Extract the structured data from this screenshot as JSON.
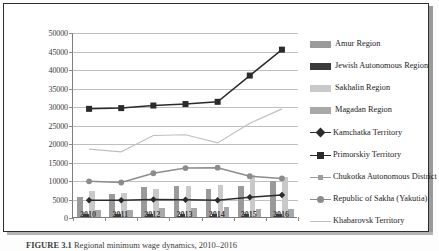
{
  "figure": {
    "caption_prefix": "FIGURE 3.1",
    "caption_text": "Regional minimum wage dynamics, 2010–2016"
  },
  "chart_data": {
    "type": "bar",
    "title": "",
    "xlabel": "",
    "ylabel": "",
    "categories": [
      "2010",
      "2011",
      "2012",
      "2013",
      "2014",
      "2015",
      "2016"
    ],
    "ylim": [
      0,
      50000
    ],
    "ytick_step": 5000,
    "yticks": [
      "0",
      "5000",
      "10000",
      "15000",
      "20000",
      "25000",
      "30000",
      "35000",
      "40000",
      "45000",
      "50000"
    ],
    "grid": true,
    "legend_position": "right",
    "bar_series": [
      {
        "name": "Amur Region",
        "color": "#9a9a9a",
        "values": [
          5500,
          6200,
          8000,
          8400,
          7600,
          8300,
          9800
        ]
      },
      {
        "name": "Jewish Autonomous Region",
        "color": "#3a3a3a",
        "values": [
          700,
          800,
          750,
          950,
          900,
          850,
          900
        ]
      },
      {
        "name": "Sakhalin Region",
        "color": "#c9c9c9",
        "values": [
          7000,
          6500,
          7600,
          8500,
          8600,
          11300,
          10700
        ]
      },
      {
        "name": "Magadan Region",
        "color": "#a8a8a8",
        "values": [
          1800,
          2000,
          2400,
          2500,
          2700,
          2300,
          2300
        ]
      }
    ],
    "line_series": [
      {
        "name": "Kamchatka Territory",
        "color": "#2b2b2b",
        "marker": "diamond",
        "values": [
          4800,
          4800,
          5000,
          4900,
          4800,
          5600,
          6200
        ]
      },
      {
        "name": "Primorskiy Territory",
        "color": "#2b2b2b",
        "marker": "square",
        "values": [
          29500,
          29700,
          30400,
          30800,
          31400,
          38500,
          45500
        ]
      },
      {
        "name": "Chukotka Autonomous District",
        "color": "#9d9d9d",
        "marker": "none",
        "values": [
          null,
          null,
          null,
          null,
          null,
          null,
          null
        ]
      },
      {
        "name": "Republic of Sakha (Yakutia)",
        "color": "#8c8c8c",
        "marker": "circle",
        "values": [
          9900,
          9600,
          12100,
          13500,
          13600,
          11300,
          10700
        ]
      },
      {
        "name": "Khabarovsk Territory",
        "color": "#c0c0c0",
        "marker": "none",
        "values": [
          18600,
          17900,
          22300,
          22500,
          20300,
          25600,
          29500
        ]
      }
    ],
    "legend_entries": [
      {
        "label": "Amur Region",
        "type": "bar",
        "color": "#9a9a9a",
        "marker": "none"
      },
      {
        "label": "Jewish Autonomous Region",
        "type": "bar",
        "color": "#3a3a3a",
        "marker": "none"
      },
      {
        "label": "Sakhalin Region",
        "type": "bar",
        "color": "#c9c9c9",
        "marker": "none"
      },
      {
        "label": "Magadan Region",
        "type": "bar",
        "color": "#a8a8a8",
        "marker": "none"
      },
      {
        "label": "Kamchatka Territory",
        "type": "line",
        "color": "#2b2b2b",
        "marker": "diamond"
      },
      {
        "label": "Primorskiy Territory",
        "type": "line",
        "color": "#2b2b2b",
        "marker": "square"
      },
      {
        "label": "Chukotka Autonomous District",
        "type": "line",
        "color": "#9d9d9d",
        "marker": "tick"
      },
      {
        "label": "Republic of Sakha (Yakutia)",
        "type": "line",
        "color": "#8c8c8c",
        "marker": "circle"
      },
      {
        "label": "Khabarovsk Territory",
        "type": "line",
        "color": "#c0c0c0",
        "marker": "none"
      }
    ]
  }
}
